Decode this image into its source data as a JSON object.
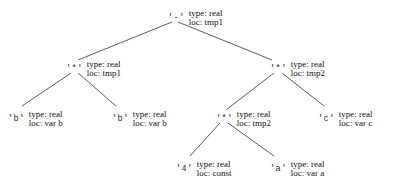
{
  "diagram": {
    "type": "tree",
    "background_color": "#ffffff",
    "line_color": "#4a4a4a",
    "text_color": "#101010"
  },
  "nodes": [
    {
      "id": "root",
      "symbol": "'-'",
      "type_line": "type: real",
      "loc_line": "loc: tmp1",
      "x": 168,
      "y": 9,
      "anchor_x": 175,
      "anchor_y": 22
    },
    {
      "id": "mul-left",
      "symbol": "'*'",
      "type_line": "type: real",
      "loc_line": "loc: tmp1",
      "x": 66,
      "y": 60,
      "anchor_x": 74,
      "anchor_y": 73
    },
    {
      "id": "mul-right",
      "symbol": "'*'",
      "type_line": "type: real",
      "loc_line": "loc: tmp2",
      "x": 270,
      "y": 60,
      "anchor_x": 278,
      "anchor_y": 73
    },
    {
      "id": "b-left",
      "symbol": "'b'",
      "type_line": "type: real",
      "loc_line": "loc: var b",
      "x": 8,
      "y": 110,
      "anchor_x": 16,
      "anchor_y": 108
    },
    {
      "id": "b-right",
      "symbol": "'b'",
      "type_line": "type: real",
      "loc_line": "loc: var b",
      "x": 112,
      "y": 110,
      "anchor_x": 120,
      "anchor_y": 108
    },
    {
      "id": "mul-inner",
      "symbol": "'*'",
      "type_line": "type: real",
      "loc_line": "loc: tmp2",
      "x": 216,
      "y": 110,
      "anchor_x": 224,
      "anchor_y": 123
    },
    {
      "id": "c-leaf",
      "symbol": "'c'",
      "type_line": "type: real",
      "loc_line": "loc: var c",
      "x": 318,
      "y": 110,
      "anchor_x": 326,
      "anchor_y": 108
    },
    {
      "id": "four-leaf",
      "symbol": "'4'",
      "type_line": "type: real",
      "loc_line": "loc: const",
      "x": 176,
      "y": 160,
      "anchor_x": 184,
      "anchor_y": 158
    },
    {
      "id": "a-leaf",
      "symbol": "'a'",
      "type_line": "type: real",
      "loc_line": "loc: var a",
      "x": 270,
      "y": 160,
      "anchor_x": 278,
      "anchor_y": 158
    }
  ],
  "edges": [
    {
      "id": "root-to-mul-left",
      "x1": 172,
      "y1": 22,
      "x2": 78,
      "y2": 60
    },
    {
      "id": "root-to-mul-right",
      "x1": 178,
      "y1": 22,
      "x2": 272,
      "y2": 60
    },
    {
      "id": "mul-left-to-b-left",
      "x1": 71,
      "y1": 73,
      "x2": 22,
      "y2": 106
    },
    {
      "id": "mul-left-to-b-right",
      "x1": 78,
      "y1": 73,
      "x2": 116,
      "y2": 106
    },
    {
      "id": "mul-right-to-inner",
      "x1": 274,
      "y1": 73,
      "x2": 226,
      "y2": 110
    },
    {
      "id": "mul-right-to-c",
      "x1": 282,
      "y1": 73,
      "x2": 324,
      "y2": 106
    },
    {
      "id": "inner-to-four",
      "x1": 220,
      "y1": 123,
      "x2": 190,
      "y2": 156
    },
    {
      "id": "inner-to-a",
      "x1": 228,
      "y1": 123,
      "x2": 274,
      "y2": 156
    }
  ]
}
